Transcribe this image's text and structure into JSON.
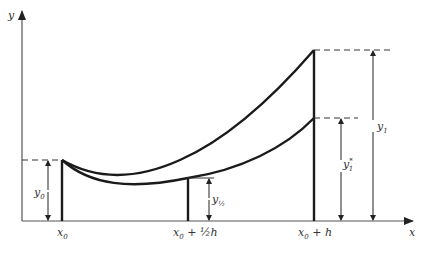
{
  "diagram": {
    "type": "euler-step-comparison",
    "axes": {
      "x_label": "x",
      "y_label": "y"
    },
    "x_ticks": [
      {
        "id": "x0",
        "label_main": "x",
        "label_sub": "0",
        "label_suffix": ""
      },
      {
        "id": "x0_half_h",
        "label_main": "x",
        "label_sub": "0",
        "label_suffix": " + ½h"
      },
      {
        "id": "x0_h",
        "label_main": "x",
        "label_sub": "0",
        "label_suffix": " + h"
      }
    ],
    "measurements": [
      {
        "id": "y0",
        "label_main": "y",
        "label_sub": "0"
      },
      {
        "id": "y_half",
        "label_main": "y",
        "label_sub": "½"
      },
      {
        "id": "y1_star",
        "label_main": "y",
        "label_sub": "1",
        "label_sup": "*"
      },
      {
        "id": "y1",
        "label_main": "y",
        "label_sub": "1"
      }
    ],
    "curves": [
      {
        "id": "single-step-curve",
        "description": "one full step of size h from x0 to x0+h"
      },
      {
        "id": "two-half-step-curve",
        "description": "two half steps from x0 through x0+½h to x0+h"
      }
    ],
    "colors": {
      "line": "#1a1a1a",
      "axis": "#555555",
      "text": "#333333"
    }
  }
}
